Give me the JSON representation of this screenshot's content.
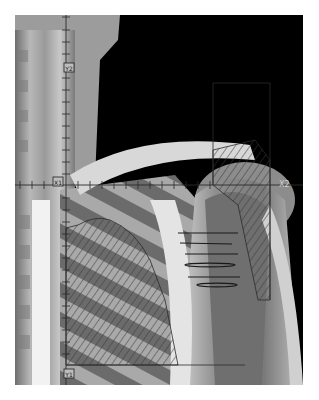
{
  "image": {
    "description": "Radiotherapy simulation film of right shoulder and upper chest with field outline, shielding blocks and central-axis crosshair",
    "background": "#ffffff",
    "film_bounds": {
      "x": 15,
      "y": 15,
      "width": 288,
      "height": 370
    }
  },
  "axes": {
    "vertical_x": 66,
    "horizontal_y": 185,
    "tick_spacing": 12,
    "color": "#2a2a2a"
  },
  "labels": {
    "x2": "X2",
    "marker_top": "Y2",
    "marker_left": "X1",
    "marker_bottom": "Y1"
  },
  "field": {
    "outline_color": "#1e1e1e",
    "hatch_color": "#3a3a3a"
  },
  "wires": {
    "count": 6,
    "color": "#1a1a1a"
  }
}
